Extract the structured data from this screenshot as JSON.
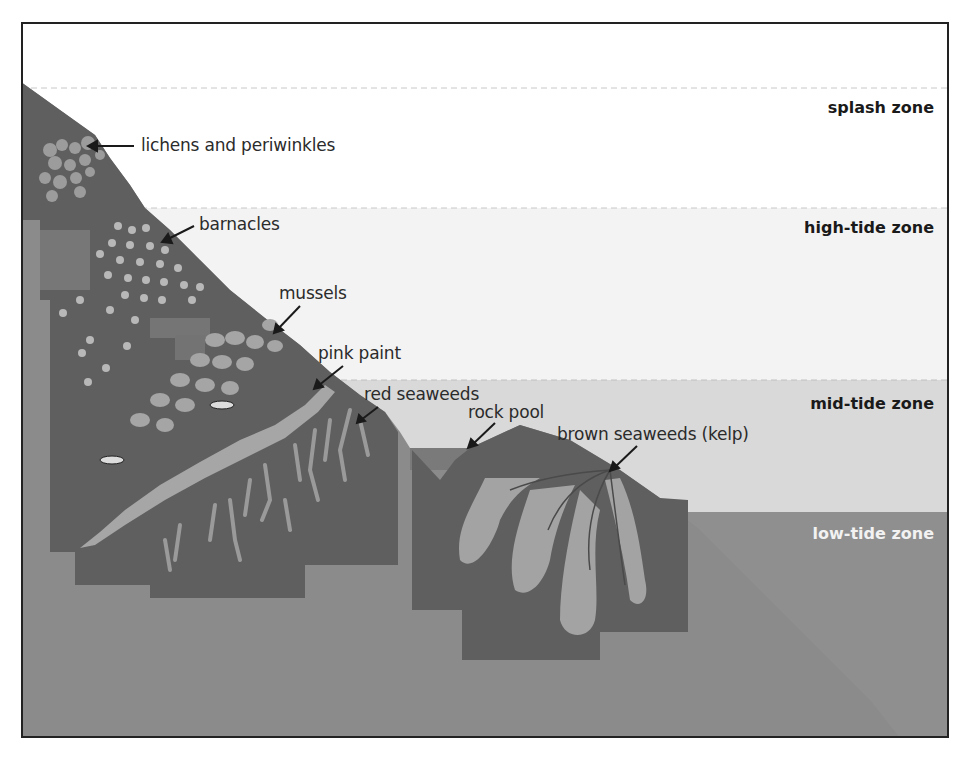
{
  "diagram": {
    "zones": [
      {
        "id": "splash",
        "label": "splash zone",
        "color": "#ffffff",
        "text_color": "#1a1a1a"
      },
      {
        "id": "high",
        "label": "high-tide zone",
        "color": "#f4f4f4",
        "text_color": "#1a1a1a"
      },
      {
        "id": "mid",
        "label": "mid-tide zone",
        "color": "#d8d8d8",
        "text_color": "#1a1a1a"
      },
      {
        "id": "low",
        "label": "low-tide zone",
        "color": "#8c8c8c",
        "text_color": "#f2f2f2"
      }
    ],
    "annotations": [
      {
        "id": "lichens",
        "label": "lichens and periwinkles"
      },
      {
        "id": "barnacles",
        "label": "barnacles"
      },
      {
        "id": "mussels",
        "label": "mussels"
      },
      {
        "id": "pink-paint",
        "label": "pink paint"
      },
      {
        "id": "red-seaweeds",
        "label": "red seaweeds"
      },
      {
        "id": "rock-pool",
        "label": "rock pool"
      },
      {
        "id": "kelp",
        "label": "brown seaweeds (kelp)"
      }
    ],
    "colors": {
      "rock_light": "#8a8a8a",
      "rock_mid": "#6e6e6e",
      "rock_dark": "#5a5a5a",
      "organism": "#a9a9a9",
      "border": "#222222"
    }
  }
}
